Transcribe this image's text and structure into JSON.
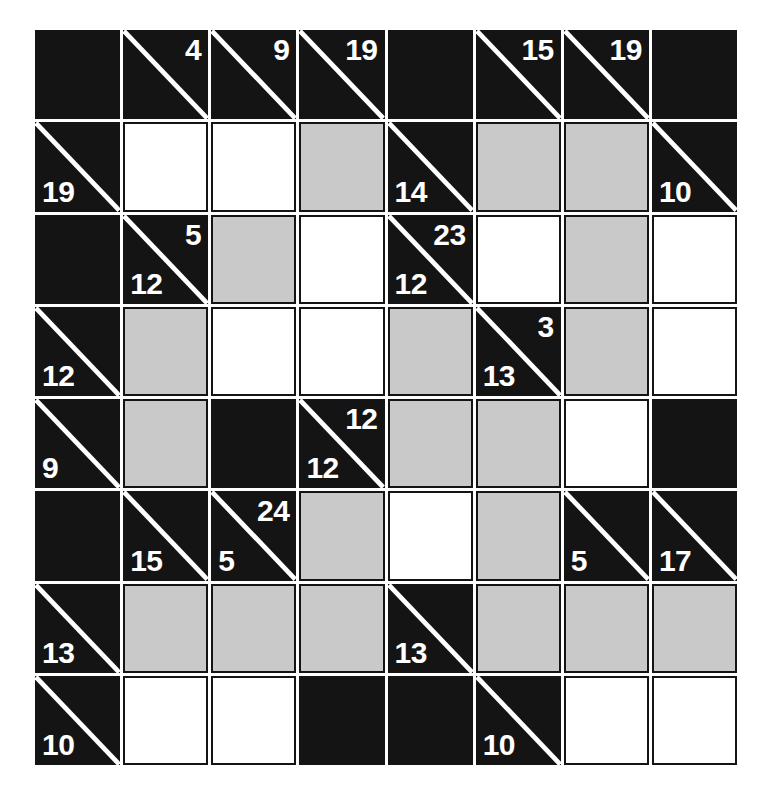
{
  "puzzle": {
    "type": "kakuro",
    "rows": 8,
    "cols": 8,
    "colors": {
      "block": "#141414",
      "empty_white": "#ffffff",
      "empty_gray": "#c9c9c9",
      "clue_text": "#ffffff",
      "grid_line": "#141414"
    },
    "cells": [
      [
        {
          "kind": "block"
        },
        {
          "kind": "clue",
          "down": "4"
        },
        {
          "kind": "clue",
          "down": "9"
        },
        {
          "kind": "clue",
          "down": "19"
        },
        {
          "kind": "block"
        },
        {
          "kind": "clue",
          "down": "15"
        },
        {
          "kind": "clue",
          "down": "19"
        },
        {
          "kind": "block"
        }
      ],
      [
        {
          "kind": "clue",
          "across": "19"
        },
        {
          "kind": "white"
        },
        {
          "kind": "white"
        },
        {
          "kind": "gray"
        },
        {
          "kind": "clue",
          "across": "14"
        },
        {
          "kind": "gray"
        },
        {
          "kind": "gray"
        },
        {
          "kind": "clue",
          "across": "10"
        }
      ],
      [
        {
          "kind": "block"
        },
        {
          "kind": "clue",
          "across": "12",
          "down": "5"
        },
        {
          "kind": "gray"
        },
        {
          "kind": "white"
        },
        {
          "kind": "clue",
          "across": "12",
          "down": "23"
        },
        {
          "kind": "white"
        },
        {
          "kind": "gray"
        },
        {
          "kind": "white"
        }
      ],
      [
        {
          "kind": "clue",
          "across": "12"
        },
        {
          "kind": "gray"
        },
        {
          "kind": "white"
        },
        {
          "kind": "white"
        },
        {
          "kind": "gray"
        },
        {
          "kind": "clue",
          "across": "13",
          "down": "3"
        },
        {
          "kind": "gray"
        },
        {
          "kind": "white"
        }
      ],
      [
        {
          "kind": "clue",
          "across": "9"
        },
        {
          "kind": "gray"
        },
        {
          "kind": "block"
        },
        {
          "kind": "clue",
          "across": "12",
          "down": "12"
        },
        {
          "kind": "gray"
        },
        {
          "kind": "gray"
        },
        {
          "kind": "white"
        },
        {
          "kind": "block"
        }
      ],
      [
        {
          "kind": "block"
        },
        {
          "kind": "clue",
          "across": "15"
        },
        {
          "kind": "clue",
          "across": "5",
          "down": "24"
        },
        {
          "kind": "gray"
        },
        {
          "kind": "white"
        },
        {
          "kind": "gray"
        },
        {
          "kind": "clue",
          "across": "5"
        },
        {
          "kind": "clue",
          "across": "17"
        }
      ],
      [
        {
          "kind": "clue",
          "across": "13"
        },
        {
          "kind": "gray"
        },
        {
          "kind": "gray"
        },
        {
          "kind": "gray"
        },
        {
          "kind": "clue",
          "across": "13"
        },
        {
          "kind": "gray"
        },
        {
          "kind": "gray"
        },
        {
          "kind": "gray"
        }
      ],
      [
        {
          "kind": "clue",
          "across": "10"
        },
        {
          "kind": "white"
        },
        {
          "kind": "white"
        },
        {
          "kind": "block"
        },
        {
          "kind": "block"
        },
        {
          "kind": "clue",
          "across": "10"
        },
        {
          "kind": "white"
        },
        {
          "kind": "white"
        }
      ]
    ]
  }
}
